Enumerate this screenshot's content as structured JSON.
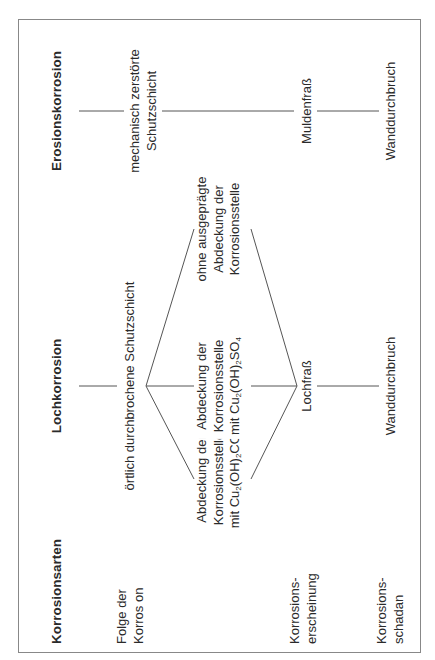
{
  "diagram": {
    "headers": {
      "label_column": "Korrosionsarten",
      "col1": "Lochkorrosion",
      "col2": "Erosionskorrosion"
    },
    "row_labels": {
      "consequence": [
        "Folge der",
        "Korros on"
      ],
      "appearance": [
        "Korrosions-",
        "erscheinung"
      ],
      "damage": [
        "Korrosions-",
        "schadan"
      ]
    },
    "lochkorrosion": {
      "consequence": "örtlich durchbrochene Schutzschicht",
      "branches": [
        {
          "lines": [
            "Abdeckung der",
            "Korrosionsstelle"
          ],
          "formula": {
            "prefix": "mit Cu",
            "sub1": "2",
            "mid": "(OH)",
            "sub2": "2",
            "suffix": "CO",
            "sub3": "3"
          }
        },
        {
          "lines": [
            "Abdeckung der",
            "Korrosionsstelle"
          ],
          "formula": {
            "prefix": "mit Cu",
            "sub1": "2",
            "mid": "(OH)",
            "sub2": "2",
            "suffix": "SO",
            "sub3": "4"
          }
        },
        {
          "lines": [
            "ohne ausgeprägte",
            "Abdeckung der",
            "Korrosionsstelle"
          ]
        }
      ],
      "appearance": "Lochfraß",
      "damage": "Wanddurchbruch"
    },
    "erosionskorrosion": {
      "consequence": [
        "mechanisch zerstörte",
        "Schutzschicht"
      ],
      "appearance": "Muldenfraß",
      "damage": "Wanddurchbruch"
    },
    "colors": {
      "line": "#555555",
      "frame": "#888888",
      "text": "#2a2a2a"
    }
  }
}
